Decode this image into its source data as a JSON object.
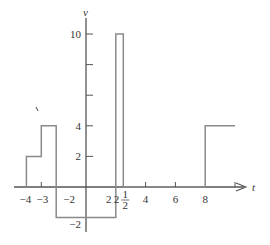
{
  "chart_data": {
    "type": "line",
    "subtype": "piecewise-constant step function",
    "title": "",
    "xlabel": "t",
    "ylabel": "v",
    "xlim": [
      -4.5,
      10.3
    ],
    "ylim": [
      -2.6,
      10.8
    ],
    "grid": false,
    "legend": null,
    "x_ticks": [
      {
        "value": -4,
        "label": "−4"
      },
      {
        "value": -3,
        "label": "−3"
      },
      {
        "value": -2,
        "label": "−2"
      },
      {
        "value": 2,
        "label": "2"
      },
      {
        "value": 2.5,
        "label": "2½",
        "whole": "2",
        "num": "1",
        "den": "2"
      },
      {
        "value": 4,
        "label": "4"
      },
      {
        "value": 6,
        "label": "6"
      },
      {
        "value": 8,
        "label": "8"
      },
      {
        "value": 10,
        "label": ""
      }
    ],
    "y_ticks": [
      {
        "value": 10,
        "label": "10"
      },
      {
        "value": 8,
        "label": ""
      },
      {
        "value": 6,
        "label": ""
      },
      {
        "value": 4,
        "label": "4"
      },
      {
        "value": 2,
        "label": "2"
      },
      {
        "value": -2,
        "label": "−2"
      }
    ],
    "series": [
      {
        "name": "v(t)",
        "segments": [
          {
            "t_start": -4,
            "t_end": -3,
            "v": 2
          },
          {
            "t_start": -3,
            "t_end": -2,
            "v": 4
          },
          {
            "t_start": -2,
            "t_end": 2,
            "v": -2
          },
          {
            "t_start": 2,
            "t_end": 2.5,
            "v": 10
          },
          {
            "t_start": 2.5,
            "t_end": 8,
            "v": 0
          },
          {
            "t_start": 8,
            "t_end": 10,
            "v": 4
          }
        ],
        "x": [
          -4,
          -4,
          -3,
          -3,
          -2,
          -2,
          2,
          2,
          2.5,
          2.5,
          8,
          8,
          10
        ],
        "y": [
          0,
          2,
          2,
          4,
          4,
          -2,
          -2,
          10,
          10,
          0,
          0,
          4,
          4
        ]
      }
    ],
    "colors": {
      "line": "#8a8a8a",
      "axis": "#555555",
      "text": "#333333"
    }
  }
}
